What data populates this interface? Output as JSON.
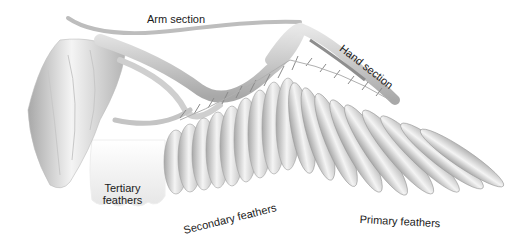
{
  "diagram": {
    "type": "anatomical illustration",
    "labels": {
      "arm_section": "Arm section",
      "hand_section": "Hand section",
      "tertiary_line1": "Tertiary",
      "tertiary_line2": "feathers",
      "secondary": "Secondary feathers",
      "primary": "Primary feathers"
    },
    "colors": {
      "feather_light": "#f2f2f2",
      "feather_mid": "#cfcfcf",
      "feather_dark": "#9a9a9a",
      "bone": "#bdbdbd",
      "text": "#1a1a1a"
    }
  }
}
